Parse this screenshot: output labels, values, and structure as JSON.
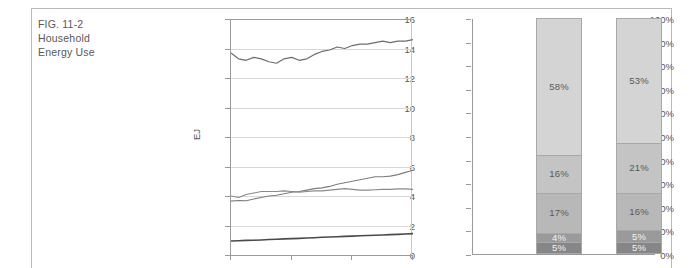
{
  "figure": {
    "caption_lines": [
      "FIG. 11-2",
      "Household",
      "Energy Use"
    ]
  },
  "colors": {
    "text": "#58585a",
    "axis": "#9a9a9c",
    "grid": "#d8d8da",
    "frame": "#b9b9bb",
    "seg_lightest": "#d4d4d4",
    "seg_light": "#c4c4c4",
    "seg_mid": "#b8b8b8",
    "seg_dark": "#9a9a9a",
    "seg_darkest": "#868686",
    "line_top": "#6d6d6f",
    "line_mid_a": "#8a8a8c",
    "line_mid_b": "#7d7d7f",
    "line_bottom": "#4a4a4c"
  },
  "chart_data": [
    {
      "type": "line",
      "title": "",
      "xlabel": "",
      "ylabel": "EJ",
      "ylim": [
        0,
        16
      ],
      "yticks": [
        "0",
        "2",
        "4",
        "6",
        "8",
        "10",
        "12",
        "14",
        "16"
      ],
      "grid": true,
      "legend": "none",
      "xticks": [
        "",
        "",
        "",
        ""
      ],
      "x": [
        0,
        1,
        2,
        3,
        4,
        5,
        6,
        7,
        8,
        9,
        10,
        11,
        12,
        13,
        14,
        15,
        16,
        17,
        18,
        19,
        20,
        21,
        22,
        23,
        24
      ],
      "series": [
        {
          "name": "total",
          "values": [
            13.7,
            13.3,
            13.2,
            13.4,
            13.3,
            13.1,
            13.0,
            13.3,
            13.4,
            13.2,
            13.3,
            13.6,
            13.8,
            13.9,
            14.1,
            14.0,
            14.2,
            14.3,
            14.3,
            14.4,
            14.5,
            14.4,
            14.5,
            14.5,
            14.6
          ]
        },
        {
          "name": "upper-mid",
          "values": [
            4.0,
            3.9,
            4.1,
            4.2,
            4.3,
            4.3,
            4.3,
            4.35,
            4.3,
            4.25,
            4.3,
            4.35,
            4.35,
            4.4,
            4.45,
            4.5,
            4.45,
            4.4,
            4.4,
            4.42,
            4.45,
            4.45,
            4.48,
            4.48,
            4.45
          ]
        },
        {
          "name": "lower-mid",
          "values": [
            3.65,
            3.7,
            3.68,
            3.8,
            3.9,
            4.0,
            4.05,
            4.15,
            4.25,
            4.3,
            4.4,
            4.5,
            4.55,
            4.65,
            4.8,
            4.9,
            5.0,
            5.1,
            5.2,
            5.3,
            5.3,
            5.35,
            5.45,
            5.6,
            5.75
          ]
        },
        {
          "name": "bottom",
          "values": [
            0.95,
            0.97,
            0.99,
            1.0,
            1.02,
            1.05,
            1.07,
            1.09,
            1.11,
            1.13,
            1.15,
            1.17,
            1.2,
            1.22,
            1.24,
            1.26,
            1.28,
            1.3,
            1.32,
            1.34,
            1.36,
            1.38,
            1.4,
            1.42,
            1.45
          ]
        }
      ]
    },
    {
      "type": "bar",
      "subtype": "stacked-100",
      "title": "",
      "xlabel": "",
      "ylabel": "",
      "ylim": [
        0,
        100
      ],
      "yticks": [
        "0%",
        "10%",
        "20%",
        "30%",
        "40%",
        "50%",
        "60%",
        "70%",
        "80%",
        "90%",
        "100%"
      ],
      "categories": [
        "",
        ""
      ],
      "segments": [
        {
          "category": "",
          "values": [
            {
              "label": "5%",
              "value": 5,
              "shade": "darkest",
              "text": "light"
            },
            {
              "label": "4%",
              "value": 4,
              "shade": "dark",
              "text": "light"
            },
            {
              "label": "17%",
              "value": 17,
              "shade": "mid",
              "text": "dark"
            },
            {
              "label": "16%",
              "value": 16,
              "shade": "light",
              "text": "dark"
            },
            {
              "label": "58%",
              "value": 58,
              "shade": "lightest",
              "text": "dark"
            }
          ]
        },
        {
          "category": "",
          "values": [
            {
              "label": "5%",
              "value": 5,
              "shade": "darkest",
              "text": "light"
            },
            {
              "label": "5%",
              "value": 5,
              "shade": "dark",
              "text": "light"
            },
            {
              "label": "16%",
              "value": 16,
              "shade": "mid",
              "text": "dark"
            },
            {
              "label": "21%",
              "value": 21,
              "shade": "light",
              "text": "dark"
            },
            {
              "label": "53%",
              "value": 53,
              "shade": "lightest",
              "text": "dark"
            }
          ]
        }
      ]
    }
  ]
}
